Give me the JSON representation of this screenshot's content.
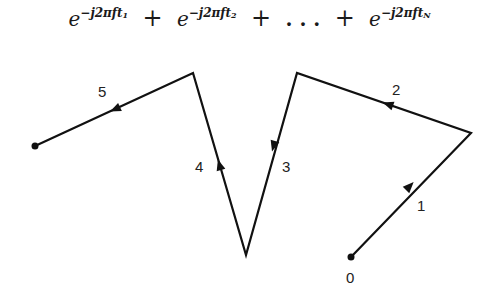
{
  "formula": {
    "terms": [
      {
        "base": "e",
        "exponent": "−j2πft",
        "subscript": "1"
      },
      {
        "base": "e",
        "exponent": "−j2πft",
        "subscript": "2"
      },
      {
        "base": "e",
        "exponent": "−j2πft",
        "subscript": "N"
      }
    ],
    "operator": "+",
    "ellipsis": ". . ."
  },
  "diagram": {
    "stroke_color": "#111111",
    "origin_label": "0",
    "vectors": [
      {
        "label": "1",
        "from": [
          351,
          257
        ],
        "to": [
          471,
          133
        ]
      },
      {
        "label": "2",
        "from": [
          471,
          133
        ],
        "to": [
          297,
          73
        ]
      },
      {
        "label": "3",
        "from": [
          297,
          73
        ],
        "to": [
          246,
          255
        ]
      },
      {
        "label": "4",
        "from": [
          246,
          255
        ],
        "to": [
          193,
          73
        ]
      },
      {
        "label": "5",
        "from": [
          193,
          73
        ],
        "to": [
          35,
          146
        ]
      }
    ]
  }
}
